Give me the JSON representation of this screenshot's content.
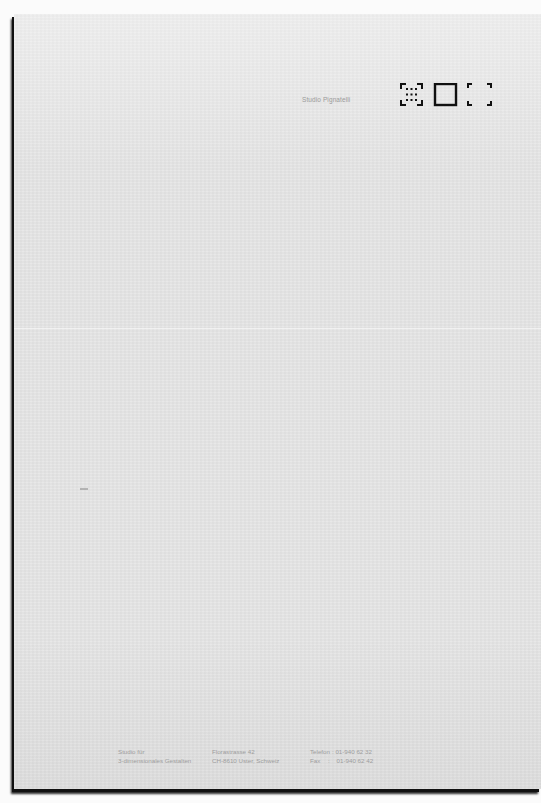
{
  "letterhead": {
    "sender_name": "Studio Pignatelli",
    "logo": {
      "glyphs": [
        "dotted-grid-square-icon",
        "solid-square-icon",
        "corner-brackets-icon"
      ],
      "color": "#111111"
    }
  },
  "footer": {
    "studio": {
      "line1": "Studio für",
      "line2": "3-dimensionales Gestalten"
    },
    "address": {
      "line1": "Florastrasse 42",
      "line2": "CH-8610 Uster, Schweiz"
    },
    "contact": {
      "phone_label": "Telefon",
      "phone_value": "01-940 62 32",
      "fax_label": "Fax",
      "fax_value": "01-940 62 42"
    }
  },
  "colors": {
    "paper": "#e6e6e6",
    "background": "#fbfbfb",
    "text": "#9d9d9d",
    "shadow": "#111111"
  }
}
